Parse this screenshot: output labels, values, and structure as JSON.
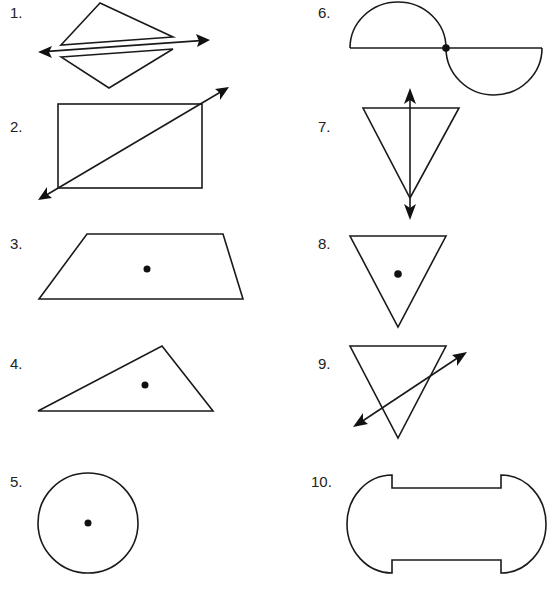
{
  "worksheet": {
    "items": [
      {
        "number": "1.",
        "shape": "two triangles separated by a line with arrows",
        "has_line": true,
        "has_point": false
      },
      {
        "number": "2.",
        "shape": "rectangle with diagonal line with arrows",
        "has_line": true,
        "has_point": false
      },
      {
        "number": "3.",
        "shape": "trapezoid with center point",
        "has_line": false,
        "has_point": true
      },
      {
        "number": "4.",
        "shape": "scalene triangle with interior point",
        "has_line": false,
        "has_point": true
      },
      {
        "number": "5.",
        "shape": "circle with center point",
        "has_line": false,
        "has_point": true
      },
      {
        "number": "6.",
        "shape": "two semicircles on a line with a point",
        "has_line": false,
        "has_point": true
      },
      {
        "number": "7.",
        "shape": "inverted triangle with vertical line with arrows",
        "has_line": true,
        "has_point": false
      },
      {
        "number": "8.",
        "shape": "inverted triangle with center point",
        "has_line": false,
        "has_point": true
      },
      {
        "number": "9.",
        "shape": "inverted triangle with oblique line with arrows",
        "has_line": true,
        "has_point": false
      },
      {
        "number": "10.",
        "shape": "capsule with notched sides",
        "has_line": false,
        "has_point": false
      }
    ]
  },
  "colors": {
    "stroke": "#1a1a1a",
    "background": "#ffffff"
  }
}
